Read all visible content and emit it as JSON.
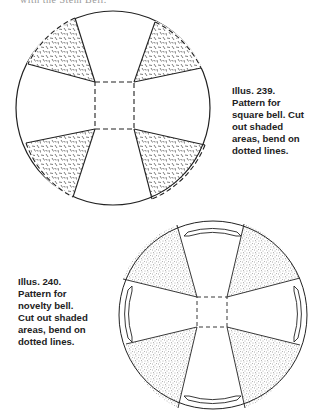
{
  "page": {
    "clipped_top_text": "with the Stem Bell."
  },
  "figures": [
    {
      "id": "illus-239",
      "caption_lines": [
        "Illus. 239.",
        "Pattern for",
        "square bell. Cut",
        "out shaded",
        "areas, bend on",
        "dotted lines."
      ]
    },
    {
      "id": "illus-240",
      "caption_lines": [
        "Illus. 240.",
        "Pattern for",
        "novelty bell.",
        "Cut out shaded",
        "areas, bend on",
        "dotted lines."
      ]
    }
  ],
  "colors": {
    "line": "#222222",
    "shade": "#555555",
    "background": "#ffffff"
  }
}
